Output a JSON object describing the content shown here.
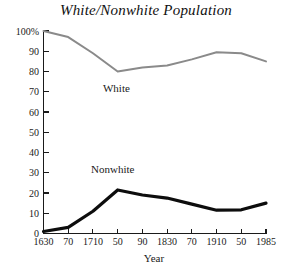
{
  "chart_data": {
    "type": "line",
    "title": "White/Nonwhite Population",
    "xlabel": "Year",
    "ylabel": "",
    "xlim": [
      1630,
      1985
    ],
    "ylim": [
      0,
      100
    ],
    "grid": false,
    "legend_position": "inline-annotations",
    "x": [
      1630,
      1670,
      1710,
      1750,
      1790,
      1830,
      1870,
      1910,
      1950,
      1985
    ],
    "xtick_labels": [
      "1630",
      "70",
      "1710",
      "50",
      "90",
      "1830",
      "70",
      "1910",
      "50",
      "1985"
    ],
    "ytick_labels": [
      "0",
      "10",
      "20",
      "30",
      "40",
      "50",
      "60",
      "70",
      "80",
      "90",
      "100%"
    ],
    "ytick_values": [
      0,
      10,
      20,
      30,
      40,
      50,
      60,
      70,
      80,
      90,
      100
    ],
    "series": [
      {
        "name": "White",
        "color": "#8a8a8a",
        "stroke_width": 2.0,
        "values": [
          100,
          97,
          89,
          80,
          82,
          83,
          86,
          89.5,
          89,
          85
        ],
        "label_x": 1748,
        "label_y": 70
      },
      {
        "name": "Nonwhite",
        "color": "#0d0d0d",
        "stroke_width": 3.2,
        "values": [
          1,
          3,
          11,
          21.5,
          19,
          17.5,
          14.5,
          11.5,
          11.7,
          15
        ],
        "label_x": 1742,
        "label_y": 30
      }
    ],
    "annotations": [
      {
        "text": "White",
        "x": 1748,
        "y": 70
      },
      {
        "text": "Nonwhite",
        "x": 1742,
        "y": 30
      }
    ]
  }
}
